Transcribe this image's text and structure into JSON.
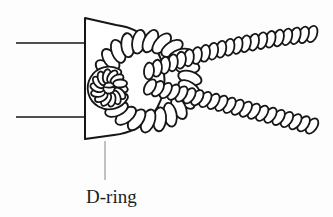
{
  "figure": {
    "caption": {
      "text": "D-ring"
    },
    "drawing": "twisted-rope-girth-hitched-to-d-ring",
    "colors": {
      "background": "#fdfdfd",
      "ink": "#161616",
      "rope_fill": "#ffffff",
      "leader_line": "#9a9a9a",
      "caption_color": "#1c1c1c"
    }
  }
}
